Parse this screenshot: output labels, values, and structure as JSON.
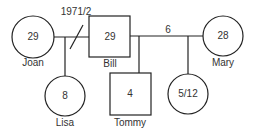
{
  "diagram": {
    "type": "genogram",
    "annotations": {
      "divorce_year": "1971/2",
      "marriage_duration": "6"
    },
    "people": [
      {
        "name": "Joan",
        "age": "29",
        "sex": "female",
        "generation": 1
      },
      {
        "name": "Bill",
        "age": "29",
        "sex": "male",
        "generation": 1
      },
      {
        "name": "Mary",
        "age": "28",
        "sex": "female",
        "generation": 1
      },
      {
        "name": "Lisa",
        "age": "8",
        "sex": "female",
        "generation": 2
      },
      {
        "name": "Tommy",
        "age": "4",
        "sex": "male",
        "generation": 2
      },
      {
        "name": "",
        "age": "5/12",
        "sex": "female",
        "generation": 2
      }
    ],
    "relationships": [
      {
        "type": "divorced",
        "from": "Joan",
        "to": "Bill",
        "label": "1971/2"
      },
      {
        "type": "married",
        "from": "Bill",
        "to": "Mary",
        "label": "6"
      },
      {
        "type": "child",
        "parents": [
          "Joan",
          "Bill"
        ],
        "child": "Lisa"
      },
      {
        "type": "child",
        "parents": [
          "Bill",
          "Mary"
        ],
        "child": "Tommy"
      },
      {
        "type": "child",
        "parents": [
          "Bill",
          "Mary"
        ],
        "child": "5/12"
      }
    ]
  }
}
